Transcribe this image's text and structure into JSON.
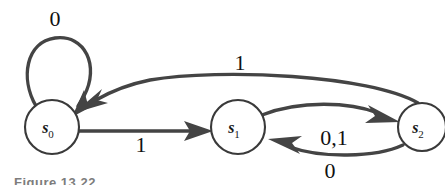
{
  "figure": {
    "type": "finite-state-machine",
    "caption": "Figure 13.22",
    "background_color": "#ffffff",
    "stroke_color": "#444444",
    "label_color": "#111111"
  },
  "states": [
    {
      "id": "s0",
      "name": "s",
      "subscript": "0",
      "cx": 52,
      "cy": 127,
      "r": 27
    },
    {
      "id": "s1",
      "name": "s",
      "subscript": "1",
      "cx": 238,
      "cy": 127,
      "r": 27
    },
    {
      "id": "s2",
      "name": "s",
      "subscript": "2",
      "cx": 422,
      "cy": 127,
      "r": 24
    }
  ],
  "transitions": [
    {
      "id": "t-s0-s0",
      "from": "s0",
      "to": "s0",
      "label": "0",
      "shape": "self-loop-top",
      "label_x": 55,
      "label_y": 26
    },
    {
      "id": "t-s0-s1",
      "from": "s0",
      "to": "s1",
      "label": "1",
      "shape": "straight",
      "label_x": 141,
      "label_y": 152
    },
    {
      "id": "t-s1-s2",
      "from": "s1",
      "to": "s2",
      "label": "0,1",
      "shape": "arc-up",
      "label_x": 334,
      "label_y": 145
    },
    {
      "id": "t-s2-s1",
      "from": "s2",
      "to": "s1",
      "label": "0",
      "shape": "arc-down",
      "label_x": 330,
      "label_y": 178
    },
    {
      "id": "t-s2-s0",
      "from": "s2",
      "to": "s0",
      "label": "1",
      "shape": "long-arc-top",
      "label_x": 240,
      "label_y": 70
    }
  ]
}
